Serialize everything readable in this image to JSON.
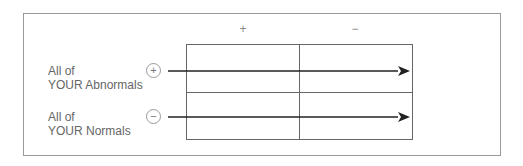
{
  "columns": [
    {
      "label": "+"
    },
    {
      "label": "−"
    }
  ],
  "rows": [
    {
      "line1": "All of",
      "line2": "YOUR Abnormals",
      "sign": "+"
    },
    {
      "line1": "All of",
      "line2": "YOUR Normals",
      "sign": "−"
    }
  ],
  "colors": {
    "grid": "#666666",
    "arrow": "#222222",
    "frame": "#9a9a9a"
  }
}
